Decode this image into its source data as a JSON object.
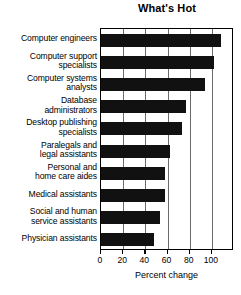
{
  "chart_data": {
    "type": "bar",
    "orientation": "horizontal",
    "title": "What's Hot",
    "xlabel": "Percent change",
    "ylabel": "",
    "xlim": [
      0,
      120
    ],
    "xticks": [
      0,
      20,
      40,
      60,
      80,
      100
    ],
    "grid": true,
    "legend": false,
    "bar_color": "#111111",
    "categories": [
      "Computer engineers",
      "Computer support specialists",
      "Computer systems analysts",
      "Database administrators",
      "Desktop publishing specialists",
      "Paralegals and legal assistants",
      "Personal and home care aides",
      "Medical assistants",
      "Social and human service assistants",
      "Physician assistants"
    ],
    "category_lines": [
      [
        "Computer engineers"
      ],
      [
        "Computer support",
        "specialists"
      ],
      [
        "Computer systems",
        "analysts"
      ],
      [
        "Database",
        "administrators"
      ],
      [
        "Desktop publishing",
        "specialists"
      ],
      [
        "Paralegals and",
        "legal assistants"
      ],
      [
        "Personal and",
        "home care aides"
      ],
      [
        "Medical assistants"
      ],
      [
        "Social and human",
        "service assistants"
      ],
      [
        "Physician assistants"
      ]
    ],
    "values": [
      108,
      102,
      94,
      77,
      73,
      62,
      58,
      58,
      53,
      48
    ]
  }
}
